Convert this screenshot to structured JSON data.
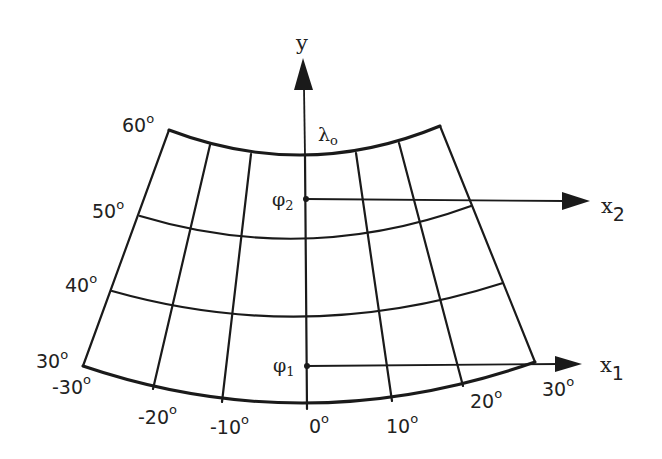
{
  "diagram": {
    "axes": {
      "y": {
        "label": "y"
      },
      "x2": {
        "label": "x",
        "subscript": "2"
      },
      "x1": {
        "label": "x",
        "subscript": "1"
      }
    },
    "central_meridian": {
      "symbol": "λ",
      "subscript": "o"
    },
    "standard_parallels": [
      {
        "symbol": "φ",
        "subscript": "2"
      },
      {
        "symbol": "φ",
        "subscript": "1"
      }
    ],
    "latitude_labels": [
      {
        "value": "60",
        "deg": "o"
      },
      {
        "value": "50",
        "deg": "o"
      },
      {
        "value": "40",
        "deg": "o"
      },
      {
        "value": "30",
        "deg": "o"
      }
    ],
    "longitude_labels": [
      {
        "value": "-30",
        "deg": "o"
      },
      {
        "value": "-20",
        "deg": "o"
      },
      {
        "value": "-10",
        "deg": "o"
      },
      {
        "value": "0",
        "deg": "o"
      },
      {
        "value": "10",
        "deg": "o"
      },
      {
        "value": "20",
        "deg": "o"
      },
      {
        "value": "30",
        "deg": "o"
      }
    ],
    "colors": {
      "ink": "#1a1a1a",
      "background": "#ffffff"
    }
  }
}
